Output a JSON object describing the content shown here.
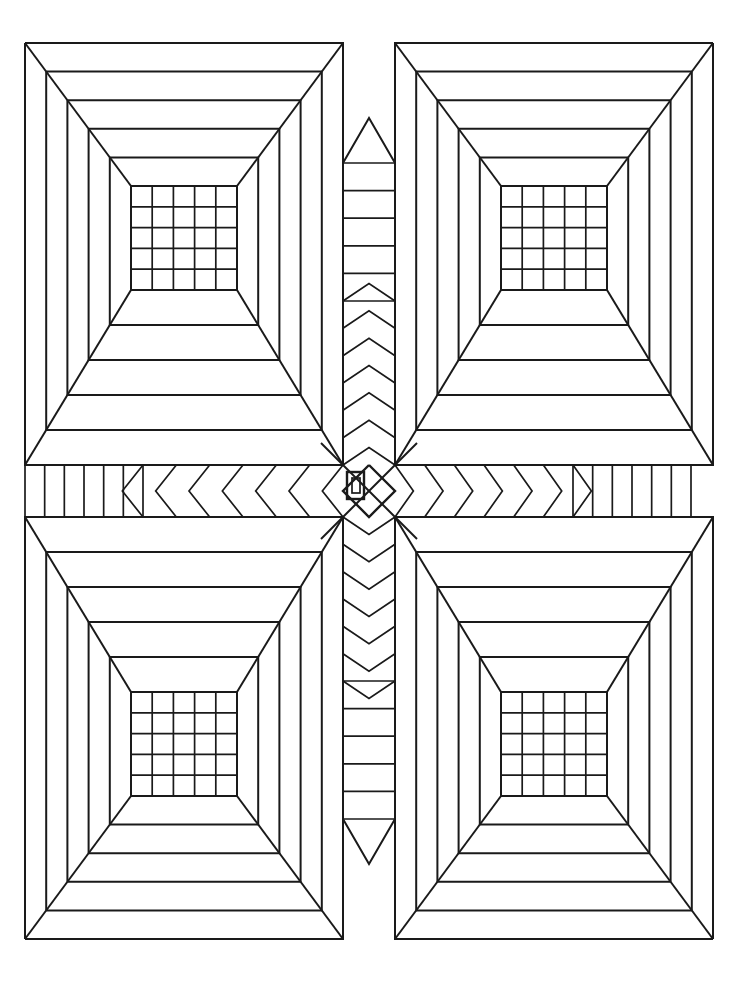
{
  "document": {
    "title": "Geometric Quilt Block Coloring Page",
    "kind": "line-art",
    "width": 738,
    "height": 992,
    "background_color": "#ffffff",
    "line_color": "#1a1a1a",
    "line_width": 2,
    "symmetry": "four-fold mirror (horizontal and vertical axes)"
  },
  "geometry": {
    "center": {
      "x": 369,
      "y": 491
    },
    "outer_bounds": {
      "left": 25,
      "top": 43,
      "right": 691,
      "bottom": 933
    },
    "band_half_width": 26,
    "quadrant_inner_corner": {
      "x": 343,
      "y": 465
    },
    "frame_count": 5,
    "grid_rows": 5,
    "grid_cols": 5
  },
  "quadrants": [
    {
      "name": "top-left-tunnel",
      "label": "Top Left Perspective Box",
      "outer": {
        "x": 25,
        "y": 43,
        "w": 318,
        "h": 422
      },
      "inner_grid": {
        "x": 131,
        "y": 186,
        "w": 106,
        "h": 104
      }
    },
    {
      "name": "top-right-tunnel",
      "label": "Top Right Perspective Box",
      "outer": {
        "x": 395,
        "y": 43,
        "w": 296,
        "h": 422
      },
      "inner_grid": {
        "x": 489,
        "y": 186,
        "w": 106,
        "h": 104
      }
    },
    {
      "name": "bottom-left-tunnel",
      "label": "Bottom Left Perspective Box",
      "outer": {
        "x": 25,
        "y": 517,
        "w": 318,
        "h": 416
      },
      "inner_grid": {
        "x": 131,
        "y": 690,
        "w": 106,
        "h": 104
      }
    },
    {
      "name": "bottom-right-tunnel",
      "label": "Bottom Right Perspective Box",
      "outer": {
        "x": 395,
        "y": 517,
        "w": 296,
        "h": 416
      },
      "inner_grid": {
        "x": 489,
        "y": 690,
        "w": 106,
        "h": 104
      }
    }
  ],
  "bands": {
    "horizontal": {
      "name": "horizontal-center-band",
      "y_top": 465,
      "y_bottom": 517,
      "left_bar_count": 6,
      "left_chevron_count": 6,
      "right_bar_count": 6,
      "right_chevron_count": 6,
      "chevron_direction_left": "points-left",
      "chevron_direction_right": "points-right"
    },
    "vertical": {
      "name": "vertical-center-band",
      "x_left": 343,
      "x_right": 395,
      "top_bar_count": 5,
      "top_chevron_count": 6,
      "bottom_bar_count": 5,
      "bottom_chevron_count": 6,
      "chevron_direction_top": "points-up",
      "chevron_direction_bottom": "points-down"
    }
  },
  "center_motif": {
    "name": "center-medallion",
    "outer_rect": {
      "x": 347,
      "y": 472,
      "w": 17,
      "h": 27
    },
    "inner_rect": {
      "x": 352,
      "y": 478,
      "w": 8,
      "h": 15
    },
    "diamond_radius_x": 26,
    "diamond_radius_y": 26,
    "has_x_diagonals": true
  },
  "palette": {
    "ink": "#1a1a1a",
    "paper": "#ffffff"
  }
}
